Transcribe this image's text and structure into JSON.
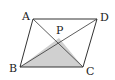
{
  "figure": {
    "vertices": {
      "A": {
        "label": "A",
        "x": 33,
        "y": 19
      },
      "D": {
        "label": "D",
        "x": 97,
        "y": 19
      },
      "B": {
        "label": "B",
        "x": 20,
        "y": 67
      },
      "C": {
        "label": "C",
        "x": 83,
        "y": 67
      },
      "P": {
        "label": "P",
        "x": 59,
        "y": 38
      }
    },
    "shaded_region": {
      "name": "triangle PBC",
      "color": "#d0d0d0"
    },
    "stroke_color": "#333333"
  }
}
